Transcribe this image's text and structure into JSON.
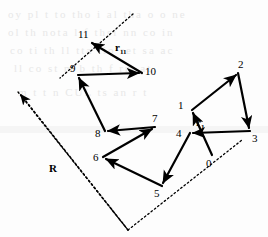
{
  "figure": {
    "type": "diagram",
    "width": 268,
    "height": 237,
    "background_color": "#fdfdfd",
    "stroke_color": "#000000"
  },
  "nodes": [
    {
      "id": "0",
      "label": "0",
      "x": 212,
      "y": 155,
      "label_x": 206,
      "label_y": 158
    },
    {
      "id": "1",
      "label": "1",
      "x": 192,
      "y": 110,
      "label_x": 178,
      "label_y": 100
    },
    {
      "id": "2",
      "label": "2",
      "x": 238,
      "y": 73,
      "label_x": 238,
      "label_y": 59
    },
    {
      "id": "3",
      "label": "3",
      "x": 250,
      "y": 131,
      "label_x": 252,
      "label_y": 133
    },
    {
      "id": "4",
      "label": "4",
      "x": 190,
      "y": 133,
      "label_x": 176,
      "label_y": 128
    },
    {
      "id": "5",
      "label": "5",
      "x": 162,
      "y": 186,
      "label_x": 154,
      "label_y": 188
    },
    {
      "id": "6",
      "label": "6",
      "x": 103,
      "y": 157,
      "label_x": 93,
      "label_y": 152
    },
    {
      "id": "7",
      "label": "7",
      "x": 155,
      "y": 127,
      "label_x": 152,
      "label_y": 113
    },
    {
      "id": "8",
      "label": "8",
      "x": 105,
      "y": 131,
      "label_x": 95,
      "label_y": 128
    },
    {
      "id": "9",
      "label": "9",
      "x": 78,
      "y": 75,
      "label_x": 70,
      "label_y": 63
    },
    {
      "id": "10",
      "label": "10",
      "x": 142,
      "y": 73,
      "label_x": 145,
      "label_y": 66
    },
    {
      "id": "11",
      "label": "11",
      "x": 89,
      "y": 41,
      "label_x": 78,
      "label_y": 29
    }
  ],
  "bonds": [
    {
      "name": "bond-0-1",
      "from": "0",
      "to": "1"
    },
    {
      "name": "bond-1-2",
      "from": "1",
      "to": "2"
    },
    {
      "name": "bond-2-3",
      "from": "2",
      "to": "3"
    },
    {
      "name": "bond-3-4",
      "from": "3",
      "to": "4"
    },
    {
      "name": "bond-4-5",
      "from": "4",
      "to": "5"
    },
    {
      "name": "bond-5-6",
      "from": "5",
      "to": "6"
    },
    {
      "name": "bond-6-7",
      "from": "6",
      "to": "7"
    },
    {
      "name": "bond-7-8",
      "from": "7",
      "to": "8"
    },
    {
      "name": "bond-8-9",
      "from": "8",
      "to": "9"
    },
    {
      "name": "bond-9-10",
      "from": "9",
      "to": "10"
    },
    {
      "name": "bond-10-11",
      "from": "10",
      "to": "11"
    }
  ],
  "vector_labels": {
    "r1": {
      "text": "r",
      "subscript": "1",
      "x": 196,
      "y": 117
    },
    "r11": {
      "text": "r",
      "subscript": "11",
      "x": 115,
      "y": 42
    },
    "R": {
      "text": "R",
      "x": 49,
      "y": 163
    }
  },
  "end_to_end_vector": {
    "name": "R",
    "from_node": "0",
    "to_node": "11",
    "style": "dotted",
    "arrow_tip_x": 18,
    "arrow_tip_y": 92,
    "description": "Dotted parallelogram construction of end-to-end displacement R from monomer 0 to monomer 11"
  },
  "dotted_guides": [
    {
      "name": "guide-top",
      "x1": 133,
      "y1": 14,
      "x2": 60,
      "y2": 78
    },
    {
      "name": "guide-left",
      "x1": 60,
      "y1": 78,
      "x2": 18,
      "y2": 92
    },
    {
      "name": "guide-bottom",
      "x1": 18,
      "y1": 92,
      "x2": 128,
      "y2": 230
    },
    {
      "name": "guide-right",
      "x1": 128,
      "y1": 230,
      "x2": 242,
      "y2": 140
    }
  ],
  "background_ghost_text": [
    {
      "text": "oy pl   t   to tho  i al  tha  o  o ne",
      "x": 8,
      "y": 14
    },
    {
      "text": "ol  th  nota  l  f  thsi  nn  co  in",
      "x": 8,
      "y": 32
    },
    {
      "text": "co  ti  th ll  tta  tio  ret  sa  ac",
      "x": 10,
      "y": 50
    },
    {
      "text": "ll   co  st  m  b   th  f  rm  at",
      "x": 14,
      "y": 68
    },
    {
      "text": "m   t  t  n  CUL   ts  an  r  t",
      "x": 18,
      "y": 92
    }
  ]
}
